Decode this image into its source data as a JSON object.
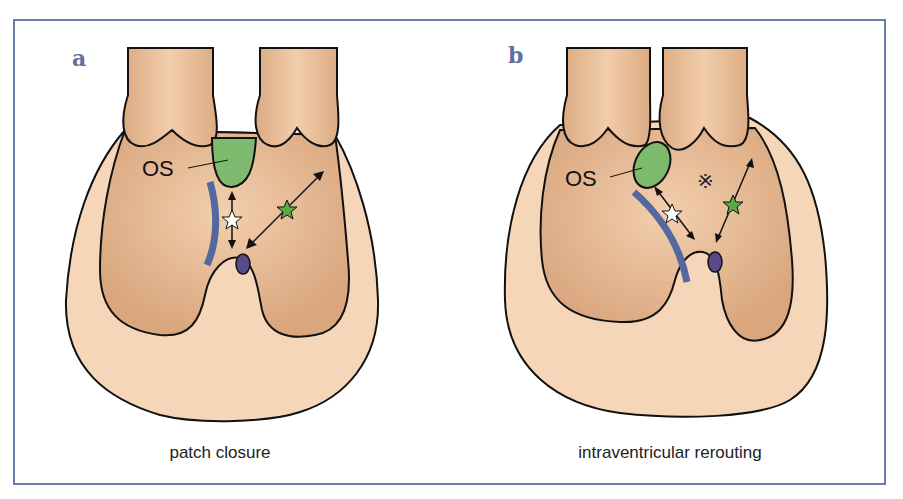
{
  "figure": {
    "panels": [
      {
        "id": "a",
        "letter": "a",
        "caption": "patch closure",
        "labels": {
          "outlet_septum": "OS"
        },
        "markers": [
          "white-star",
          "green-star",
          "vsd-oval",
          "patch"
        ]
      },
      {
        "id": "b",
        "letter": "b",
        "caption": "intraventricular rerouting",
        "labels": {
          "outlet_septum": "OS",
          "symbol": "※"
        },
        "markers": [
          "white-star",
          "green-star",
          "vsd-oval",
          "patch",
          "reference-mark"
        ]
      }
    ],
    "colors": {
      "frame": "#6b7bab",
      "letter": "#5f6f9f",
      "tissue_light": "#f6d6b8",
      "tissue_dark": "#e2b48e",
      "outlet_septum": "#7dba6e",
      "patch": "#5468a0",
      "vsd": "#5a4a8a"
    }
  }
}
